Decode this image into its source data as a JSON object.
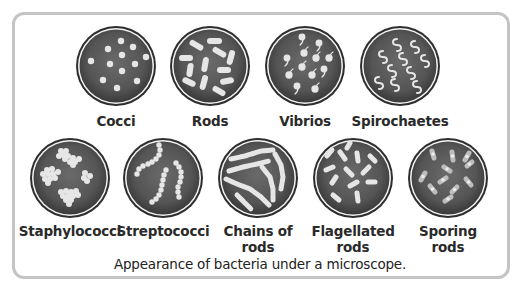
{
  "figure": {
    "caption": "Appearance of bacteria under a microscope.",
    "colors": {
      "frame": "#c4c4c4",
      "dish_fill": "#555555",
      "dish_rim": "#f2f2f2",
      "bacteria": "#e8e8e8"
    },
    "row1": [
      {
        "id": "cocci",
        "label_line1": "Cocci",
        "label_line2": ""
      },
      {
        "id": "rods",
        "label_line1": "Rods",
        "label_line2": ""
      },
      {
        "id": "vibrios",
        "label_line1": "Vibrios",
        "label_line2": ""
      },
      {
        "id": "spirochaetes",
        "label_line1": "Spirochaetes",
        "label_line2": ""
      }
    ],
    "row2": [
      {
        "id": "staphylococci",
        "label_line1": "Staphylococci",
        "label_line2": ""
      },
      {
        "id": "streptococci",
        "label_line1": "Streptococci",
        "label_line2": ""
      },
      {
        "id": "chains-of-rods",
        "label_line1": "Chains of",
        "label_line2": "rods"
      },
      {
        "id": "flagellated-rods",
        "label_line1": "Flagellated",
        "label_line2": "rods"
      },
      {
        "id": "sporing-rods",
        "label_line1": "Sporing",
        "label_line2": "rods"
      }
    ]
  }
}
